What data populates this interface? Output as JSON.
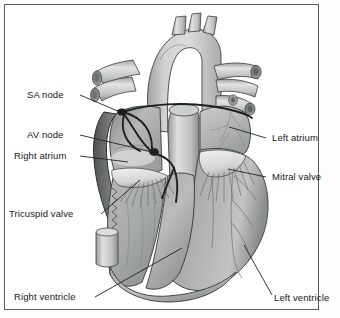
{
  "figure": {
    "type": "anatomical-illustration",
    "style": "grayscale line and tone drawing",
    "border_color": "#555a5c",
    "background_color": "#ffffff"
  },
  "labels": {
    "sa_node": "SA node",
    "av_node": "AV node",
    "right_atrium": "Right atrium",
    "tricuspid_valve": "Tricuspid valve",
    "right_ventricle": "Right ventricle",
    "left_atrium": "Left atrium",
    "mitral_valve": "Mitral valve",
    "left_ventricle": "Left ventricle"
  },
  "colors": {
    "line": "#2b2f31",
    "text": "#15181a",
    "vessel_light": "#d3d5d4",
    "vessel_mid": "#b4b7b6",
    "muscle_mid": "#a9acab",
    "muscle_dark": "#7d8180",
    "muscle_darkest": "#5e6261",
    "chamber_light": "#c6c8c7",
    "highlight": "#e8e9e8",
    "conduction": "#1d2021"
  }
}
